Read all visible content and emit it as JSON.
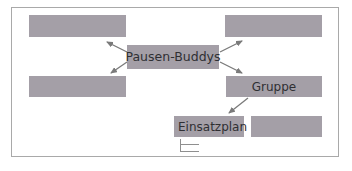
{
  "diagram": {
    "center_node": {
      "label": "Pausen-Buddys"
    },
    "nodes": [
      {
        "id": "top-left",
        "label": ""
      },
      {
        "id": "bottom-left",
        "label": ""
      },
      {
        "id": "top-right",
        "label": ""
      },
      {
        "id": "gruppe",
        "label": "Gruppe"
      },
      {
        "id": "einsatzplan",
        "label": "Einsatzplan"
      },
      {
        "id": "right-of-einsatzplan",
        "label": ""
      }
    ],
    "edges": [
      {
        "from": "Pausen-Buddys",
        "to": "top-left"
      },
      {
        "from": "Pausen-Buddys",
        "to": "bottom-left"
      },
      {
        "from": "Pausen-Buddys",
        "to": "top-right"
      },
      {
        "from": "Pausen-Buddys",
        "to": "gruppe"
      },
      {
        "from": "gruppe",
        "to": "einsatzplan"
      }
    ],
    "colors": {
      "box": "#a49fa7",
      "text": "#2f2f33",
      "arrow": "#7a7a7a",
      "frame": "#a9a9a9"
    }
  }
}
